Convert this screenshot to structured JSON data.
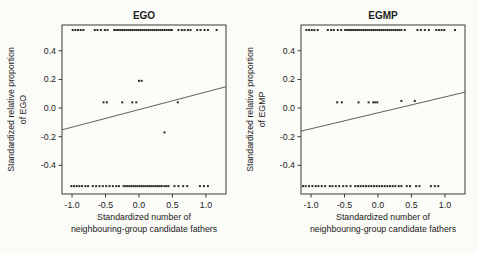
{
  "figure": {
    "background": "#fbfbf8",
    "point_color": "#2a2a2a",
    "line_color": "#4d4d4d",
    "frame_color": "#3a3a3a",
    "text_color": "#222222"
  },
  "chart_data": [
    {
      "type": "scatter",
      "title": "EGO",
      "xlabel": [
        "Standardized number of",
        "neighbouring-group candidate fathers"
      ],
      "ylabel": [
        "Standardized relative proportion",
        "of EGO"
      ],
      "xlim": [
        -1.15,
        1.3
      ],
      "ylim": [
        -0.6,
        0.58
      ],
      "xticks": [
        -1.0,
        -0.5,
        0.0,
        0.5,
        1.0
      ],
      "yticks": [
        -0.4,
        -0.2,
        0.0,
        0.2,
        0.4
      ],
      "grid": false,
      "regression_line": {
        "x1": -1.15,
        "y1": -0.152,
        "x2": 1.3,
        "y2": 0.149
      },
      "row_top": {
        "y": 0.545,
        "x": [
          -0.99,
          -0.95,
          -0.91,
          -0.87,
          -0.83,
          -0.66,
          -0.62,
          -0.57,
          -0.51,
          -0.47,
          -0.37,
          -0.34,
          -0.31,
          -0.28,
          -0.25,
          -0.22,
          -0.19,
          -0.16,
          -0.13,
          -0.1,
          -0.07,
          -0.04,
          -0.01,
          0.02,
          0.05,
          0.08,
          0.11,
          0.14,
          0.17,
          0.2,
          0.23,
          0.26,
          0.29,
          0.32,
          0.35,
          0.38,
          0.41,
          0.44,
          0.47,
          0.49,
          0.59,
          0.64,
          0.68,
          0.73,
          0.77,
          0.87,
          0.92,
          0.98,
          1.03,
          1.16
        ]
      },
      "row_bottom": {
        "y": -0.545,
        "x": [
          -1.01,
          -0.97,
          -0.93,
          -0.89,
          -0.85,
          -0.8,
          -0.76,
          -0.69,
          -0.64,
          -0.59,
          -0.54,
          -0.49,
          -0.44,
          -0.39,
          -0.34,
          -0.3,
          -0.23,
          -0.2,
          -0.17,
          -0.14,
          -0.11,
          -0.08,
          -0.05,
          -0.02,
          0.01,
          0.04,
          0.07,
          0.1,
          0.13,
          0.16,
          0.19,
          0.22,
          0.25,
          0.28,
          0.31,
          0.34,
          0.38,
          0.41,
          0.44,
          0.53,
          0.59,
          0.66,
          0.72,
          0.91,
          0.97,
          1.03
        ]
      },
      "points": [
        [
          0.0,
          0.19
        ],
        [
          0.04,
          0.19
        ],
        [
          -0.53,
          0.04
        ],
        [
          -0.48,
          0.04
        ],
        [
          -0.25,
          0.04
        ],
        [
          -0.1,
          0.04
        ],
        [
          -0.04,
          0.04
        ],
        [
          0.58,
          0.04
        ],
        [
          0.38,
          -0.17
        ]
      ]
    },
    {
      "type": "scatter",
      "title": "EGMP",
      "xlabel": [
        "Standardized number of",
        "neighbouring-group candidate fathers"
      ],
      "ylabel": [
        "Standardized relative proportion",
        "of EGMP"
      ],
      "xlim": [
        -1.15,
        1.3
      ],
      "ylim": [
        -0.6,
        0.58
      ],
      "xticks": [
        -1.0,
        -0.5,
        0.0,
        0.5,
        1.0
      ],
      "yticks": [
        -0.4,
        -0.2,
        0.0,
        0.2,
        0.4
      ],
      "grid": false,
      "regression_line": {
        "x1": -1.15,
        "y1": -0.161,
        "x2": 1.3,
        "y2": 0.111
      },
      "row_top": {
        "y": 0.545,
        "x": [
          -1.07,
          -1.03,
          -0.99,
          -0.95,
          -0.9,
          -0.75,
          -0.7,
          -0.66,
          -0.6,
          -0.55,
          -0.49,
          -0.46,
          -0.43,
          -0.4,
          -0.37,
          -0.34,
          -0.31,
          -0.28,
          -0.25,
          -0.22,
          -0.19,
          -0.16,
          -0.13,
          -0.1,
          -0.07,
          -0.04,
          -0.01,
          0.02,
          0.05,
          0.08,
          0.11,
          0.14,
          0.17,
          0.2,
          0.23,
          0.26,
          0.29,
          0.32,
          0.35,
          0.4,
          0.59,
          0.64,
          0.7,
          0.76,
          0.87,
          0.91,
          0.95,
          0.99,
          1.15
        ]
      },
      "row_bottom": {
        "y": -0.545,
        "x": [
          -1.12,
          -1.08,
          -1.03,
          -0.98,
          -0.93,
          -0.89,
          -0.84,
          -0.79,
          -0.72,
          -0.68,
          -0.63,
          -0.58,
          -0.52,
          -0.47,
          -0.41,
          -0.34,
          -0.3,
          -0.26,
          -0.22,
          -0.18,
          -0.14,
          -0.1,
          -0.06,
          -0.02,
          0.02,
          0.06,
          0.1,
          0.14,
          0.18,
          0.22,
          0.26,
          0.31,
          0.35,
          0.43,
          0.48,
          0.57,
          0.62,
          0.79,
          0.85,
          0.9
        ]
      },
      "points": [
        [
          -0.61,
          0.04
        ],
        [
          -0.54,
          0.04
        ],
        [
          -0.29,
          0.04
        ],
        [
          -0.14,
          0.04
        ],
        [
          -0.07,
          0.04
        ],
        [
          -0.04,
          0.04
        ],
        [
          -0.01,
          0.04
        ],
        [
          0.35,
          0.05
        ],
        [
          0.55,
          0.05
        ]
      ]
    }
  ]
}
